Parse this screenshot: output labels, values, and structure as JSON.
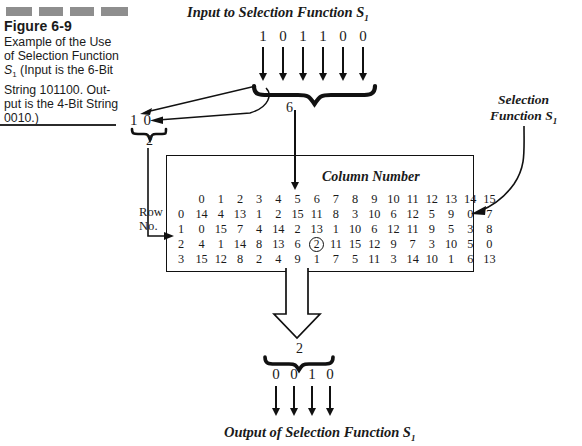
{
  "figure": {
    "number": "Figure 6-9",
    "caption_line1": "Example of the Use",
    "caption_line2": "of Selection Function",
    "caption_line3_pre": "S",
    "caption_line3_sub": "1",
    "caption_line3_post": " (Input is the 6-Bit",
    "caption_line4": "String 101100. Out-",
    "caption_line5": "put is the 4-Bit String",
    "caption_line6": "0010.)"
  },
  "headings": {
    "input_title_pre": "Input to Selection Function S",
    "input_title_sub": "1",
    "output_title_pre": "Output of Selection Function S",
    "output_title_sub": "1",
    "selection_label_line1": "Selection",
    "selection_label_line2_pre": "Function S",
    "selection_label_line2_sub": "1",
    "column_number": "Column Number",
    "row_no_line1": "Row",
    "row_no_line2": "No."
  },
  "input": {
    "bits": [
      "1",
      "0",
      "1",
      "1",
      "0",
      "0"
    ],
    "brace_label": "6"
  },
  "row_select": {
    "bits": [
      "1",
      "0"
    ],
    "brace_label": "2"
  },
  "output": {
    "brace_label": "2",
    "bits": [
      "0",
      "0",
      "1",
      "0"
    ]
  },
  "chart_data": {
    "type": "table",
    "title": "Selection Function S1",
    "column_headers": [
      "0",
      "1",
      "2",
      "3",
      "4",
      "5",
      "6",
      "7",
      "8",
      "9",
      "10",
      "11",
      "12",
      "13",
      "14",
      "15"
    ],
    "row_headers": [
      "0",
      "1",
      "2",
      "3"
    ],
    "rows": [
      [
        "14",
        "4",
        "13",
        "1",
        "2",
        "15",
        "11",
        "8",
        "3",
        "10",
        "6",
        "12",
        "5",
        "9",
        "0",
        "7"
      ],
      [
        "0",
        "15",
        "7",
        "4",
        "14",
        "2",
        "13",
        "1",
        "10",
        "6",
        "12",
        "11",
        "9",
        "5",
        "3",
        "8"
      ],
      [
        "4",
        "1",
        "14",
        "8",
        "13",
        "6",
        "2",
        "11",
        "15",
        "12",
        "9",
        "7",
        "3",
        "10",
        "5",
        "0"
      ],
      [
        "15",
        "12",
        "8",
        "2",
        "4",
        "9",
        "1",
        "7",
        "5",
        "11",
        "3",
        "14",
        "10",
        "1",
        "6",
        "13"
      ]
    ],
    "highlighted_cell": {
      "row": 2,
      "col": 6,
      "value": "2",
      "style": "circled"
    },
    "selected_row_index": 2,
    "selected_col_index": 6
  },
  "colors": {
    "ink": "#1a1a1a",
    "line": "#111111",
    "dash_gray": "#8e8e8e"
  }
}
